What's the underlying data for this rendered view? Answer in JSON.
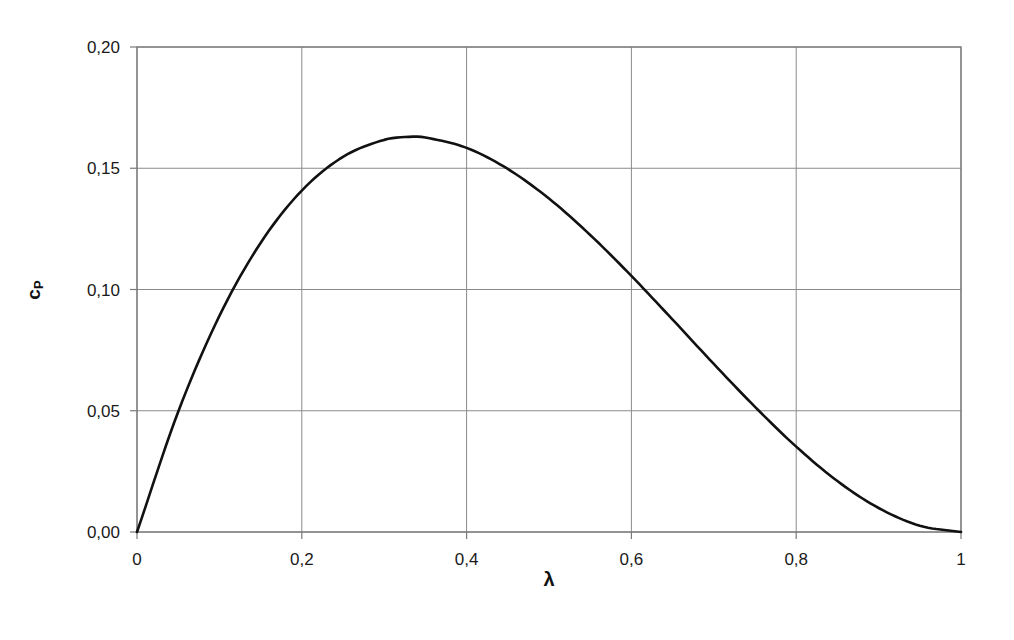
{
  "chart_data": {
    "type": "line",
    "title": "",
    "xlabel": "λ",
    "ylabel": "cP",
    "ylabel_main": "c",
    "ylabel_sub": "P",
    "xlim": [
      0,
      1
    ],
    "ylim": [
      0,
      0.2
    ],
    "grid": true,
    "legend": null,
    "x_ticks": [
      0,
      0.2,
      0.4,
      0.6,
      0.8,
      1
    ],
    "x_tick_labels": [
      "0",
      "0,2",
      "0,4",
      "0,6",
      "0,8",
      "1"
    ],
    "y_ticks": [
      0,
      0.05,
      0.1,
      0.15,
      0.2
    ],
    "y_tick_labels": [
      "0,00",
      "0,05",
      "0,10",
      "0,15",
      "0,20"
    ],
    "series": [
      {
        "name": "cP(λ)",
        "color": "#111111",
        "x": [
          0,
          0.05,
          0.1,
          0.15,
          0.2,
          0.25,
          0.3,
          0.333,
          0.35,
          0.4,
          0.45,
          0.5,
          0.55,
          0.6,
          0.65,
          0.7,
          0.75,
          0.8,
          0.85,
          0.9,
          0.95,
          1.0
        ],
        "values": [
          0,
          0.0496,
          0.0891,
          0.1192,
          0.1408,
          0.1547,
          0.1617,
          0.163,
          0.1627,
          0.1584,
          0.1497,
          0.1375,
          0.1225,
          0.1056,
          0.0876,
          0.0693,
          0.0516,
          0.0352,
          0.021,
          0.0099,
          0.0026,
          0
        ]
      }
    ]
  },
  "colors": {
    "background": "#ffffff",
    "grid": "#8a8a8a",
    "frame": "#7a7a7a",
    "curve": "#111111",
    "text": "#1a1a1a"
  }
}
